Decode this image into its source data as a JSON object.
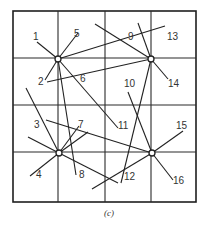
{
  "figure": {
    "caption": "(c)",
    "grid": {
      "left": 13,
      "top": 11,
      "right": 196,
      "bottom": 202,
      "columns_x": [
        58,
        105,
        151
      ],
      "rows_y": [
        58,
        105,
        152
      ]
    },
    "nodes": [
      {
        "id": "A",
        "x": 58,
        "y": 59
      },
      {
        "id": "B",
        "x": 151,
        "y": 59
      },
      {
        "id": "C",
        "x": 59,
        "y": 153
      },
      {
        "id": "D",
        "x": 152,
        "y": 153
      }
    ],
    "segments": [
      {
        "x1": 37,
        "y1": 42,
        "x2": 58,
        "y2": 59
      },
      {
        "x1": 78,
        "y1": 33,
        "x2": 58,
        "y2": 59
      },
      {
        "x1": 45,
        "y1": 80,
        "x2": 58,
        "y2": 59
      },
      {
        "x1": 58,
        "y1": 59,
        "x2": 165,
        "y2": 26
      },
      {
        "x1": 58,
        "y1": 59,
        "x2": 118,
        "y2": 128
      },
      {
        "x1": 58,
        "y1": 59,
        "x2": 76,
        "y2": 175
      },
      {
        "x1": 47,
        "y1": 82,
        "x2": 151,
        "y2": 59
      },
      {
        "x1": 95,
        "y1": 24,
        "x2": 151,
        "y2": 59
      },
      {
        "x1": 138,
        "y1": 23,
        "x2": 151,
        "y2": 59
      },
      {
        "x1": 151,
        "y1": 59,
        "x2": 168,
        "y2": 79
      },
      {
        "x1": 151,
        "y1": 59,
        "x2": 121,
        "y2": 183
      },
      {
        "x1": 26,
        "y1": 88,
        "x2": 59,
        "y2": 153
      },
      {
        "x1": 28,
        "y1": 137,
        "x2": 59,
        "y2": 153
      },
      {
        "x1": 30,
        "y1": 176,
        "x2": 59,
        "y2": 153
      },
      {
        "x1": 79,
        "y1": 126,
        "x2": 59,
        "y2": 153
      },
      {
        "x1": 88,
        "y1": 132,
        "x2": 59,
        "y2": 153
      },
      {
        "x1": 46,
        "y1": 120,
        "x2": 152,
        "y2": 153
      },
      {
        "x1": 59,
        "y1": 153,
        "x2": 118,
        "y2": 183
      },
      {
        "x1": 128,
        "y1": 92,
        "x2": 152,
        "y2": 153
      },
      {
        "x1": 152,
        "y1": 153,
        "x2": 183,
        "y2": 131
      },
      {
        "x1": 152,
        "y1": 153,
        "x2": 173,
        "y2": 180
      },
      {
        "x1": 152,
        "y1": 153,
        "x2": 92,
        "y2": 189
      }
    ],
    "labels": [
      {
        "text": "1",
        "x": 33,
        "y": 40
      },
      {
        "text": "5",
        "x": 74,
        "y": 37
      },
      {
        "text": "2",
        "x": 38,
        "y": 85
      },
      {
        "text": "6",
        "x": 80,
        "y": 82
      },
      {
        "text": "9",
        "x": 128,
        "y": 40
      },
      {
        "text": "13",
        "x": 167,
        "y": 40
      },
      {
        "text": "14",
        "x": 168,
        "y": 87
      },
      {
        "text": "10",
        "x": 124,
        "y": 87
      },
      {
        "text": "3",
        "x": 34,
        "y": 128
      },
      {
        "text": "7",
        "x": 78,
        "y": 128
      },
      {
        "text": "11",
        "x": 118,
        "y": 129
      },
      {
        "text": "15",
        "x": 176,
        "y": 129
      },
      {
        "text": "4",
        "x": 36,
        "y": 178
      },
      {
        "text": "8",
        "x": 79,
        "y": 178
      },
      {
        "text": "12",
        "x": 124,
        "y": 180
      },
      {
        "text": "16",
        "x": 173,
        "y": 184
      }
    ]
  }
}
